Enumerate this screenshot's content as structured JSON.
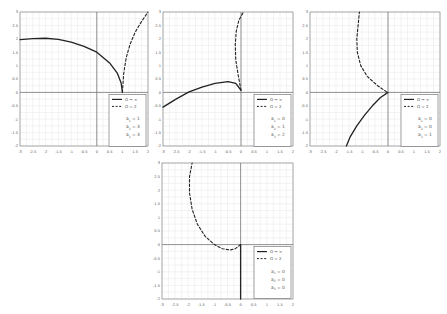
{
  "chart_data": [
    {
      "type": "line",
      "panel": "top-left",
      "title": "",
      "xlabel": "",
      "ylabel": "",
      "xlim": [
        -3,
        2
      ],
      "ylim": [
        -2,
        3
      ],
      "xticks": [
        -3,
        -2.5,
        -2,
        -1.5,
        -1,
        -0.5,
        0,
        0.5,
        1,
        1.5,
        2
      ],
      "yticks": [
        -2,
        -1.5,
        -1,
        -0.5,
        0,
        0.5,
        1,
        1.5,
        2,
        2.5,
        3
      ],
      "grid": true,
      "legend": {
        "position": "lower right",
        "entries": [
          "Ω → ∞",
          "Ω = 2"
        ],
        "params": [
          "a1 = 1",
          "a2 = 3",
          "a3 = 3"
        ]
      },
      "series": [
        {
          "name": "Ω → ∞",
          "style": "solid",
          "x": [
            -3,
            -2.5,
            -2,
            -1.5,
            -1,
            -0.5,
            0,
            0.5,
            0.8,
            0.95,
            1
          ],
          "y": [
            1.97,
            2.01,
            2.02,
            1.98,
            1.88,
            1.72,
            1.5,
            1.1,
            0.72,
            0.35,
            0
          ]
        },
        {
          "name": "Ω = 2",
          "style": "dashed",
          "x": [
            1,
            1.05,
            1.15,
            1.3,
            1.5,
            1.75,
            2
          ],
          "y": [
            0,
            0.7,
            1.3,
            1.8,
            2.25,
            2.65,
            3
          ]
        }
      ]
    },
    {
      "type": "line",
      "panel": "top-middle",
      "title": "",
      "xlabel": "",
      "ylabel": "",
      "xlim": [
        -3,
        2
      ],
      "ylim": [
        -2,
        3
      ],
      "xticks": [
        -3,
        -2.5,
        -2,
        -1.5,
        -1,
        -0.5,
        0,
        0.5,
        1,
        1.5,
        2
      ],
      "yticks": [
        -2,
        -1.5,
        -1,
        -0.5,
        0,
        0.5,
        1,
        1.5,
        2,
        2.5,
        3
      ],
      "grid": true,
      "legend": {
        "position": "lower right",
        "entries": [
          "Ω → ∞",
          "Ω = 2"
        ],
        "params": [
          "a1 = 0",
          "a2 = 1",
          "a3 = 2"
        ]
      },
      "series": [
        {
          "name": "Ω → ∞",
          "style": "solid",
          "x": [
            -3,
            -2.5,
            -2,
            -1.5,
            -1,
            -0.5,
            -0.2,
            0
          ],
          "y": [
            -0.55,
            -0.25,
            0.02,
            0.2,
            0.34,
            0.4,
            0.34,
            0.08
          ]
        },
        {
          "name": "Ω = 2",
          "style": "dashed",
          "x": [
            0,
            -0.1,
            -0.2,
            -0.22,
            -0.18,
            -0.08,
            0.1
          ],
          "y": [
            0.08,
            0.6,
            1.2,
            1.8,
            2.3,
            2.7,
            3
          ]
        }
      ]
    },
    {
      "type": "line",
      "panel": "top-right",
      "title": "",
      "xlabel": "",
      "ylabel": "",
      "xlim": [
        -3,
        2
      ],
      "ylim": [
        -2,
        3
      ],
      "xticks": [
        -3,
        -2.5,
        -2,
        -1.5,
        -1,
        -0.5,
        0,
        0.5,
        1,
        1.5,
        2
      ],
      "yticks": [
        -2,
        -1.5,
        -1,
        -0.5,
        0,
        0.5,
        1,
        1.5,
        2,
        2.5,
        3
      ],
      "grid": true,
      "legend": {
        "position": "lower right",
        "entries": [
          "Ω → ∞",
          "Ω = 2"
        ],
        "params": [
          "a1 = 0",
          "a2 = 0",
          "a3 = 1"
        ]
      },
      "series": [
        {
          "name": "Ω → ∞",
          "style": "solid",
          "x": [
            0,
            -0.3,
            -0.6,
            -0.9,
            -1.2,
            -1.45,
            -1.6
          ],
          "y": [
            0,
            -0.2,
            -0.5,
            -0.85,
            -1.25,
            -1.65,
            -2
          ]
        },
        {
          "name": "Ω = 2",
          "style": "dashed",
          "x": [
            -0.05,
            -0.4,
            -0.8,
            -1.05,
            -1.18,
            -1.2,
            -1.15,
            -1.1
          ],
          "y": [
            0.02,
            0.25,
            0.6,
            1.0,
            1.5,
            2.0,
            2.5,
            3
          ]
        }
      ]
    },
    {
      "type": "line",
      "panel": "bottom-center",
      "title": "",
      "xlabel": "",
      "ylabel": "",
      "xlim": [
        -3,
        2
      ],
      "ylim": [
        -2,
        3
      ],
      "xticks": [
        -3,
        -2.5,
        -2,
        -1.5,
        -1,
        -0.5,
        0,
        0.5,
        1,
        1.5,
        2
      ],
      "yticks": [
        -2,
        -1.5,
        -1,
        -0.5,
        0,
        0.5,
        1,
        1.5,
        2,
        2.5,
        3
      ],
      "grid": true,
      "legend": {
        "position": "lower right",
        "entries": [
          "Ω → ∞",
          "Ω = 2"
        ],
        "params": [
          "a1 = 0",
          "a2 = 0",
          "a3 = 0"
        ]
      },
      "series": [
        {
          "name": "Ω → ∞",
          "style": "solid",
          "x": [
            0,
            0
          ],
          "y": [
            0,
            -2
          ]
        },
        {
          "name": "Ω = 2",
          "style": "dashed",
          "x": [
            0,
            -0.2,
            -0.4,
            -0.7,
            -1.0,
            -1.35,
            -1.65,
            -1.85,
            -1.95,
            -1.95,
            -1.85
          ],
          "y": [
            0,
            -0.15,
            -0.2,
            -0.15,
            0.0,
            0.3,
            0.75,
            1.3,
            1.9,
            2.5,
            3
          ]
        }
      ]
    }
  ],
  "panels": [
    {
      "legend": {
        "line1": "Ω → ∞",
        "line2": "Ω = 2",
        "p1": "1",
        "p2": "3",
        "p3": "3"
      }
    },
    {
      "legend": {
        "line1": "Ω → ∞",
        "line2": "Ω = 2",
        "p1": "0",
        "p2": "1",
        "p3": "2"
      }
    },
    {
      "legend": {
        "line1": "Ω → ∞",
        "line2": "Ω = 2",
        "p1": "0",
        "p2": "0",
        "p3": "1"
      }
    },
    {
      "legend": {
        "line1": "Ω → ∞",
        "line2": "Ω = 2",
        "p1": "0",
        "p2": "0",
        "p3": "0"
      }
    }
  ],
  "layout": {
    "frames": [
      {
        "left": 20,
        "top": 12,
        "width": 128,
        "height": 134
      },
      {
        "left": 163,
        "top": 12,
        "width": 130,
        "height": 134
      },
      {
        "left": 310,
        "top": 12,
        "width": 130,
        "height": 134
      },
      {
        "left": 162,
        "top": 163,
        "width": 131,
        "height": 136
      }
    ],
    "colors": {
      "grid": "#e6e6e6",
      "frame": "#888888",
      "axis": "#777777",
      "curve": "#222222"
    }
  }
}
